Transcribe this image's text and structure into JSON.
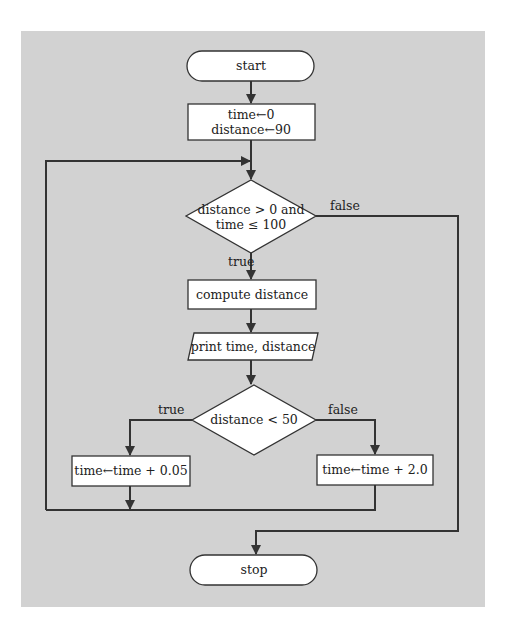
{
  "diagram": {
    "type": "flowchart",
    "background_color": "#d2d2d2",
    "nodes": {
      "start": {
        "shape": "terminator",
        "label": "start"
      },
      "init": {
        "shape": "process",
        "lines": [
          "time←0",
          "distance←90"
        ]
      },
      "loop_condition": {
        "shape": "decision",
        "lines": [
          "distance > 0 and",
          "time ≤ 100"
        ]
      },
      "compute": {
        "shape": "process",
        "label": "compute distance"
      },
      "print": {
        "shape": "io",
        "label": "print time, distance"
      },
      "branch_condition": {
        "shape": "decision",
        "label": "distance < 50"
      },
      "inc_small": {
        "shape": "process",
        "label": "time←time + 0.05"
      },
      "inc_large": {
        "shape": "process",
        "label": "time←time + 2.0"
      },
      "stop": {
        "shape": "terminator",
        "label": "stop"
      }
    },
    "edge_labels": {
      "loop_true": "true",
      "loop_false": "false",
      "branch_true": "true",
      "branch_false": "false"
    },
    "edges": [
      {
        "from": "start",
        "to": "init"
      },
      {
        "from": "init",
        "to": "loop_condition"
      },
      {
        "from": "loop_condition",
        "to": "compute",
        "label": "true"
      },
      {
        "from": "loop_condition",
        "to": "stop",
        "label": "false"
      },
      {
        "from": "compute",
        "to": "print"
      },
      {
        "from": "print",
        "to": "branch_condition"
      },
      {
        "from": "branch_condition",
        "to": "inc_small",
        "label": "true"
      },
      {
        "from": "branch_condition",
        "to": "inc_large",
        "label": "false"
      },
      {
        "from": "inc_small",
        "to": "loop_condition"
      },
      {
        "from": "inc_large",
        "to": "loop_condition"
      }
    ]
  }
}
